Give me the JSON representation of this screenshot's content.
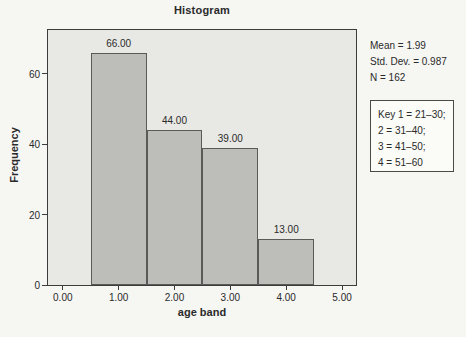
{
  "chart_data": {
    "type": "bar",
    "chart_style": "histogram",
    "title": "Histogram",
    "xlabel": "age band",
    "ylabel": "Frequency",
    "x": [
      1.0,
      2.0,
      3.0,
      4.0
    ],
    "values": [
      66,
      44,
      39,
      13
    ],
    "bar_labels": [
      "66.00",
      "44.00",
      "39.00",
      "13.00"
    ],
    "bar_width": 1,
    "xlim": [
      -0.265,
      5.25
    ],
    "ylim": [
      0,
      72.5
    ],
    "xticks": {
      "values": [
        0,
        1,
        2,
        3,
        4,
        5
      ],
      "labels": [
        "0.00",
        "1.00",
        "2.00",
        "3.00",
        "4.00",
        "5.00"
      ]
    },
    "yticks": {
      "values": [
        0,
        20,
        40,
        60
      ],
      "labels": [
        "0",
        "20",
        "40",
        "60"
      ]
    },
    "grid": false,
    "legend": "none",
    "annotations": {
      "stats": [
        "Mean = 1.99",
        "Std. Dev. = 0.987",
        "N = 162"
      ],
      "key": [
        "Key 1 = 21–30;",
        "2 = 31–40;",
        "3 = 41–50;",
        "4 = 51–60"
      ]
    },
    "colors": {
      "page_bg": "#f6f6f3",
      "plot_bg": "#e8e8e4",
      "bar_fill": "#bdbdba",
      "bar_border": "#5a5a58",
      "plot_border": "#3c3c3c",
      "text": "#2a2a2a",
      "key_box_bg": "#fbfbf8",
      "key_box_border": "#4a4a4a"
    }
  }
}
